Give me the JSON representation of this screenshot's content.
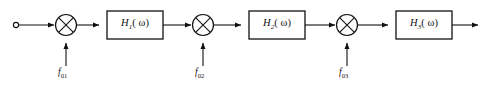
{
  "diagram": {
    "type": "signal-flow-block-diagram",
    "background_color": "#ffffff",
    "line_color": "#111111",
    "input_terminal": {
      "name": "input-terminal",
      "shape": "open-circle",
      "label": ""
    },
    "output_terminal": {
      "name": "output-arrow",
      "shape": "arrow",
      "label": ""
    },
    "mixers": [
      {
        "id": "mixer-1",
        "symbol": "⊗",
        "cx": 66,
        "cy": 25,
        "r": 10.5,
        "oscillator": {
          "id": "osc-1",
          "f": "f",
          "subscript": "01",
          "label_x": 58,
          "label_y": 70
        }
      },
      {
        "id": "mixer-2",
        "symbol": "⊗",
        "cx": 203,
        "cy": 25,
        "r": 10.5,
        "oscillator": {
          "id": "osc-2",
          "f": "f",
          "subscript": "02",
          "label_x": 195,
          "label_y": 70
        }
      },
      {
        "id": "mixer-3",
        "symbol": "⊗",
        "cx": 347,
        "cy": 25,
        "r": 10.5,
        "oscillator": {
          "id": "osc-3",
          "f": "f",
          "subscript": "03",
          "label_x": 339,
          "label_y": 70
        }
      }
    ],
    "blocks": [
      {
        "id": "block-h1",
        "h": "H",
        "subscript": "1",
        "arg": "( ω)",
        "omega": "ω",
        "x": 107,
        "y": 11,
        "width": 56,
        "height": 28
      },
      {
        "id": "block-h2",
        "h": "H",
        "subscript": "2",
        "arg": "( ω)",
        "omega": "ω",
        "x": 249,
        "y": 11,
        "width": 56,
        "height": 28
      },
      {
        "id": "block-h3",
        "h": "H",
        "subscript": "3",
        "arg": "( ω)",
        "omega": "ω",
        "x": 396,
        "y": 11,
        "width": 56,
        "height": 28
      }
    ]
  }
}
